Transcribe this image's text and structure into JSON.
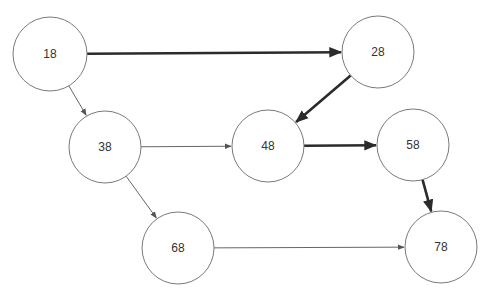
{
  "diagram": {
    "type": "directed-graph",
    "colors": {
      "node_stroke": "#7a7a7a",
      "node_fill": "#ffffff",
      "edge_thin": "#555555",
      "edge_thick": "#2b2b2b",
      "text": "#333333"
    },
    "nodes": [
      {
        "id": "n18",
        "label": "18",
        "cx": 50,
        "cy": 54,
        "r": 37
      },
      {
        "id": "n28",
        "label": "28",
        "cx": 378,
        "cy": 52,
        "r": 36
      },
      {
        "id": "n38",
        "label": "38",
        "cx": 105,
        "cy": 147,
        "r": 36
      },
      {
        "id": "n48",
        "label": "48",
        "cx": 268,
        "cy": 146,
        "r": 36
      },
      {
        "id": "n58",
        "label": "58",
        "cx": 413,
        "cy": 145,
        "r": 36
      },
      {
        "id": "n68",
        "label": "68",
        "cx": 178,
        "cy": 248,
        "r": 36
      },
      {
        "id": "n78",
        "label": "78",
        "cx": 441,
        "cy": 247,
        "r": 36
      }
    ],
    "edges": [
      {
        "from": "n18",
        "to": "n28",
        "weight": "thick"
      },
      {
        "from": "n18",
        "to": "n38",
        "weight": "thin"
      },
      {
        "from": "n28",
        "to": "n48",
        "weight": "thick"
      },
      {
        "from": "n38",
        "to": "n48",
        "weight": "thin"
      },
      {
        "from": "n38",
        "to": "n68",
        "weight": "thin"
      },
      {
        "from": "n48",
        "to": "n58",
        "weight": "thick"
      },
      {
        "from": "n58",
        "to": "n78",
        "weight": "thick"
      },
      {
        "from": "n68",
        "to": "n78",
        "weight": "thin"
      }
    ]
  }
}
